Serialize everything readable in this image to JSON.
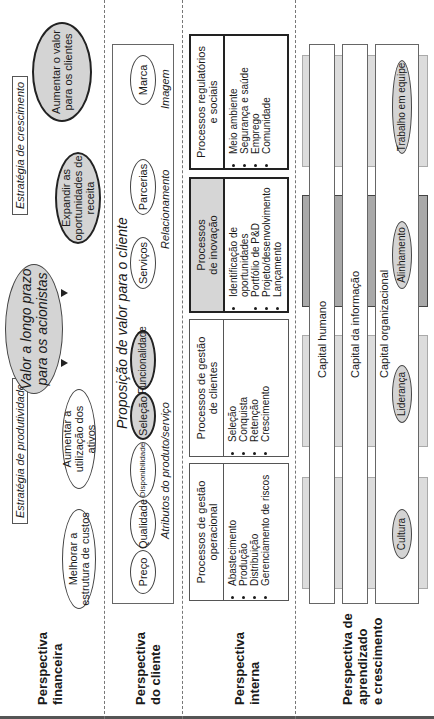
{
  "perspectives": [
    {
      "id": "financial",
      "label_line1": "Perspectiva",
      "label_line2": "financeira"
    },
    {
      "id": "customer",
      "label_line1": "Perspectiva",
      "label_line2": "do cliente"
    },
    {
      "id": "internal",
      "label_line1": "Perspectiva",
      "label_line2": "interna"
    },
    {
      "id": "learning",
      "label_line1": "Perspectiva de",
      "label_line2": "aprendizado",
      "label_line3": "e crescimento"
    }
  ],
  "financial": {
    "strategies": {
      "productivity": "Estratégia de produtividade",
      "growth": "Estratégia de crescimento"
    },
    "main_goal": {
      "line1": "Valor a longo prazo",
      "line2": "para os acionistas"
    },
    "goals": [
      {
        "line1": "Melhorar a",
        "line2": "estrutura de custos"
      },
      {
        "line1": "Aumentar a",
        "line2": "utilização dos ativos"
      },
      {
        "line1": "Expandir as",
        "line2": "oportunidades de",
        "line3": "receita"
      },
      {
        "line1": "Aumentar o valor",
        "line2": "para os clientes"
      }
    ]
  },
  "customer": {
    "title": "Proposição de valor para o cliente",
    "groups": {
      "attributes": "Atributos do produto/serviço",
      "relationship": "Relacionamento",
      "image": "Imagem"
    },
    "attributes": [
      "Preço",
      "Qualidade",
      "Disponibilidade",
      "Seleção",
      "Funcionalidade"
    ],
    "relationship": [
      "Serviços",
      "Parcerias"
    ],
    "image": [
      "Marca"
    ]
  },
  "internal": {
    "processes": [
      {
        "title_line1": "Processos de gestão",
        "title_line2": "operacional",
        "items": [
          "Abastecimento",
          "Produção",
          "Distribuição",
          "Gerenciamento de riscos"
        ]
      },
      {
        "title_line1": "Processos de gestão",
        "title_line2": "de clientes",
        "items": [
          "Seleção",
          "Conquista",
          "Retenção",
          "Crescimento"
        ]
      },
      {
        "title_line1": "Processos",
        "title_line2": "de inovação",
        "items": [
          "Identificação de oportunidades",
          "Portfólio de P&D",
          "Projeto/desenvolvimento",
          "Lançamento"
        ]
      },
      {
        "title_line1": "Processos regulatórios",
        "title_line2": "e sociais",
        "items": [
          "Meio ambiente",
          "Segurança e saúde",
          "Emprego",
          "Comunidade"
        ]
      }
    ]
  },
  "learning": {
    "capitals": [
      "Capital humano",
      "Capital da informação",
      "Capital organizacional"
    ],
    "org_elements": [
      "Cultura",
      "Liderança",
      "Alinhamento",
      "Trabalho em equipe"
    ]
  }
}
